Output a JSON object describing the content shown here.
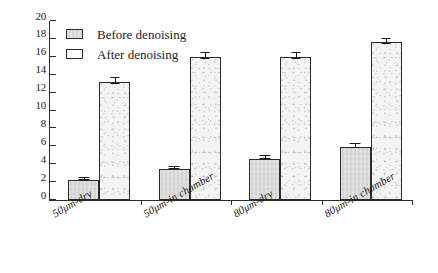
{
  "chart_data": {
    "type": "bar",
    "title": "",
    "subtitle": "",
    "xlabel": "",
    "ylabel": "",
    "ylim": [
      0,
      20
    ],
    "yticks": [
      0,
      2,
      4,
      6,
      8,
      10,
      12,
      14,
      16,
      18,
      20
    ],
    "ytick_labels": [
      "0",
      "2",
      "4",
      "6",
      "8",
      "10",
      "12",
      "14",
      "16",
      "18",
      "20"
    ],
    "grid": false,
    "legend_position": "top-left",
    "categories": [
      "50μm-dry",
      "50μm-in chamber",
      "80μm-dry",
      "80μm-in chamber"
    ],
    "series": [
      {
        "name": "Before denoising",
        "color": "#d7d7d7",
        "values": [
          2.2,
          3.5,
          4.6,
          5.9
        ],
        "errors": [
          0.12,
          0.12,
          0.18,
          0.25
        ]
      },
      {
        "name": "After denoising",
        "color": "#f4f4f4",
        "values": [
          13.2,
          16.0,
          16.0,
          17.6
        ],
        "errors": [
          0.3,
          0.3,
          0.3,
          0.25
        ]
      }
    ]
  },
  "legend": {
    "items": [
      {
        "label": "Before denoising",
        "swatch": "before"
      },
      {
        "label": "After denoising",
        "swatch": "after"
      }
    ]
  },
  "colors": {
    "axis": "#2b2b2b",
    "text": "#1a1a1a",
    "before_fill": "#d7d7d7",
    "after_fill": "#f4f4f4",
    "background": "#ffffff"
  }
}
